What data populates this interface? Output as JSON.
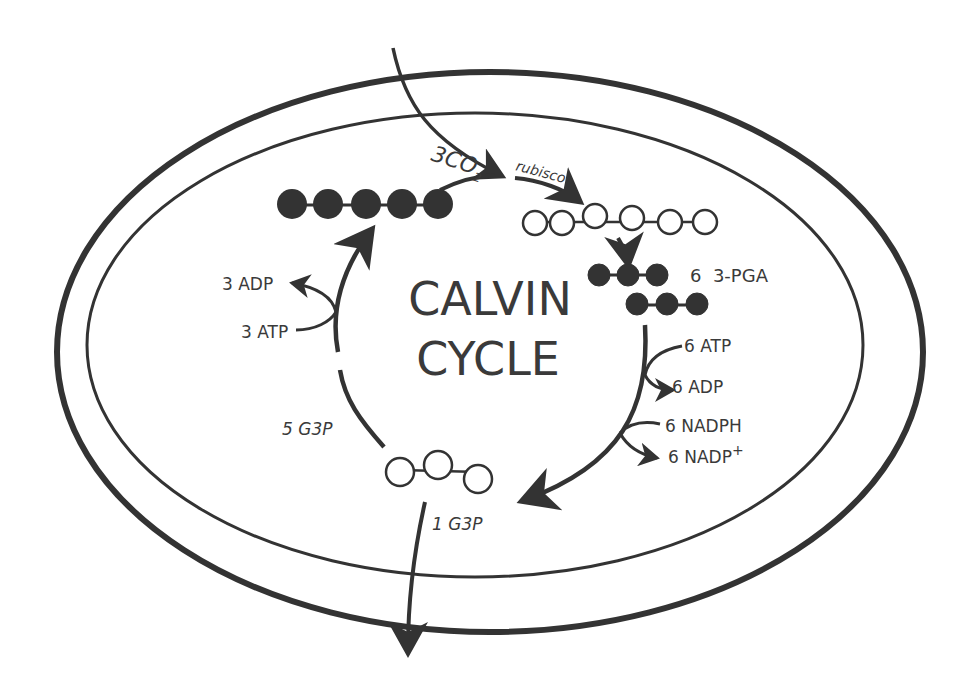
{
  "diagram": {
    "title_line1": "CALVIN",
    "title_line2": "CYCLE",
    "input": {
      "co2_count": "3",
      "co2_label": "CO",
      "co2_sub": "2",
      "enzyme": "rubisco"
    },
    "molecules": {
      "rubp": {
        "name": "RuBP (5-carbon)",
        "carbons": 5,
        "fill": "#333333"
      },
      "six_carbon": {
        "name": "6-carbon intermediate",
        "carbons": 6,
        "fill": "#ffffff"
      },
      "pga": {
        "label": "6  3-PGA",
        "carbons_per_row": 3,
        "rows": 2,
        "fill": "#333333"
      },
      "g3p": {
        "name": "G3P (3-carbon)",
        "carbons": 3,
        "fill": "#ffffff"
      }
    },
    "labels": {
      "atp6": "6 ATP",
      "adp6": "6 ADP",
      "nadph6": "6 NADPH",
      "nadp6": "6 NADP",
      "nadp6_sup": "+",
      "g3p5": "5 G3P",
      "g3p1": "1 G3P",
      "atp3": "3 ATP",
      "adp3": "3 ADP"
    },
    "colors": {
      "ink": "#333333",
      "background": "#ffffff"
    }
  }
}
